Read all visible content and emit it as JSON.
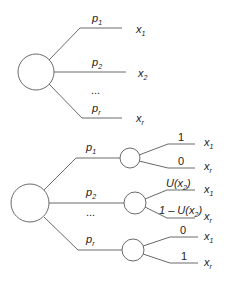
{
  "diagram": {
    "type": "decision-tree-lottery",
    "top_tree": {
      "branches": [
        {
          "prob": "p",
          "prob_sub": "1",
          "outcome": "x",
          "outcome_sub": "1"
        },
        {
          "prob": "p",
          "prob_sub": "2",
          "outcome": "x",
          "outcome_sub": "2"
        },
        {
          "prob": "p",
          "prob_sub": "r",
          "outcome": "x",
          "outcome_sub": "r"
        }
      ],
      "ellipsis": "..."
    },
    "bottom_tree": {
      "branches": [
        {
          "prob": "p",
          "prob_sub": "1",
          "sub_branches": [
            {
              "value": "1",
              "outcome": "x",
              "outcome_sub": "1"
            },
            {
              "value": "0",
              "outcome": "x",
              "outcome_sub": "r"
            }
          ]
        },
        {
          "prob": "p",
          "prob_sub": "2",
          "sub_branches": [
            {
              "value_pre": "U(x",
              "value_sub": "2",
              "value_post": ")",
              "outcome": "x",
              "outcome_sub": "1"
            },
            {
              "value_pre": "1 – U(x",
              "value_sub": "2",
              "value_post": ")",
              "outcome": "x",
              "outcome_sub": "r"
            }
          ]
        },
        {
          "prob": "p",
          "prob_sub": "r",
          "sub_branches": [
            {
              "value": "0",
              "outcome": "x",
              "outcome_sub": "1"
            },
            {
              "value": "1",
              "outcome": "x",
              "outcome_sub": "r"
            }
          ]
        }
      ],
      "ellipsis": "..."
    },
    "colors": {
      "line": "#6a6a6a",
      "text": "#222222",
      "background": "#ffffff"
    }
  }
}
